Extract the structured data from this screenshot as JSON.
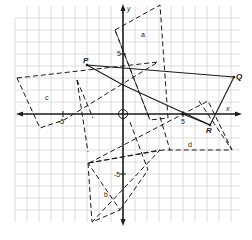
{
  "figure": {
    "type": "coordinate-plane-transformations",
    "axes": {
      "x_label": "x",
      "y_label": "y",
      "origin_label": "O",
      "x_tick_pos": "5",
      "x_tick_neg": "-5",
      "y_tick_pos": "5",
      "y_tick_neg": "-5"
    },
    "points": {
      "P": "P",
      "Q": "Q",
      "R": "R"
    },
    "regions": {
      "a": "a",
      "b": "b",
      "c": "c",
      "d": "d"
    },
    "colors": {
      "grid": "#c8c8c8",
      "ink": "#1a1a1a",
      "background": "#ffffff"
    }
  }
}
